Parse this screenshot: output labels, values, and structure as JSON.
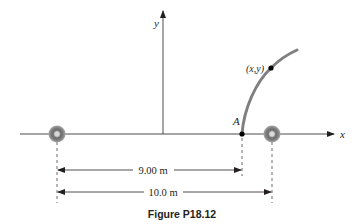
{
  "figure": {
    "caption": "Figure P18.12",
    "axes": {
      "x_label": "x",
      "y_label": "y"
    },
    "points": {
      "a_label": "A",
      "xy_label": "(x,y)"
    },
    "dimensions": {
      "inner_label": "9.00 m",
      "outer_label": "10.0 m"
    },
    "sources": [
      {
        "name": "left speaker"
      },
      {
        "name": "right speaker"
      }
    ],
    "colors": {
      "axis": "#4d4d4d",
      "curve": "#7f7f7f",
      "ring_outer": "#8c8c8c",
      "ring_inner": "#b3b3b3",
      "text": "#231f20",
      "dash": "#6d6d6d"
    }
  }
}
